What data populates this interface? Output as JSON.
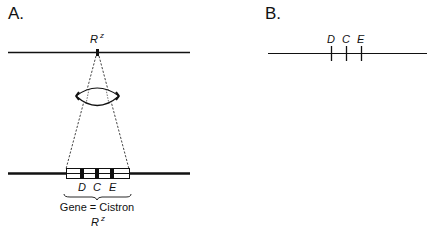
{
  "panel_a": {
    "label": "A.",
    "top_locus": {
      "symbol": "R",
      "superscript": "z"
    },
    "lens": "magnifying-lens",
    "genes": [
      {
        "label": "D"
      },
      {
        "label": "C"
      },
      {
        "label": "E"
      }
    ],
    "brace_caption": "Gene = Cistron",
    "bottom_locus": {
      "symbol": "R",
      "superscript": "z"
    }
  },
  "panel_b": {
    "label": "B.",
    "genes": [
      {
        "label": "D"
      },
      {
        "label": "C"
      },
      {
        "label": "E"
      }
    ]
  },
  "caption": {
    "visible": "partially cropped at bottom edge",
    "text": ""
  },
  "colors": {
    "ink": "#111111",
    "background": "#ffffff"
  }
}
